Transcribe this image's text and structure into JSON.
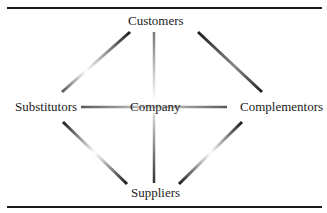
{
  "diagram": {
    "center": {
      "label": "Company"
    },
    "nodes": {
      "top": {
        "label": "Customers"
      },
      "left": {
        "label": "Substitutors"
      },
      "right": {
        "label": "Complementors"
      },
      "bottom": {
        "label": "Suppliers"
      }
    },
    "edges": [
      {
        "from": "Customers",
        "to": "Substitutors"
      },
      {
        "from": "Customers",
        "to": "Complementors"
      },
      {
        "from": "Suppliers",
        "to": "Substitutors"
      },
      {
        "from": "Suppliers",
        "to": "Complementors"
      },
      {
        "from": "Customers",
        "to": "Company"
      },
      {
        "from": "Suppliers",
        "to": "Company"
      },
      {
        "from": "Substitutors",
        "to": "Company"
      },
      {
        "from": "Complementors",
        "to": "Company"
      }
    ],
    "colors": {
      "line_dark": "#1a1a1a",
      "line_light": "#ffffff",
      "rule": "#1a1a1a"
    }
  }
}
